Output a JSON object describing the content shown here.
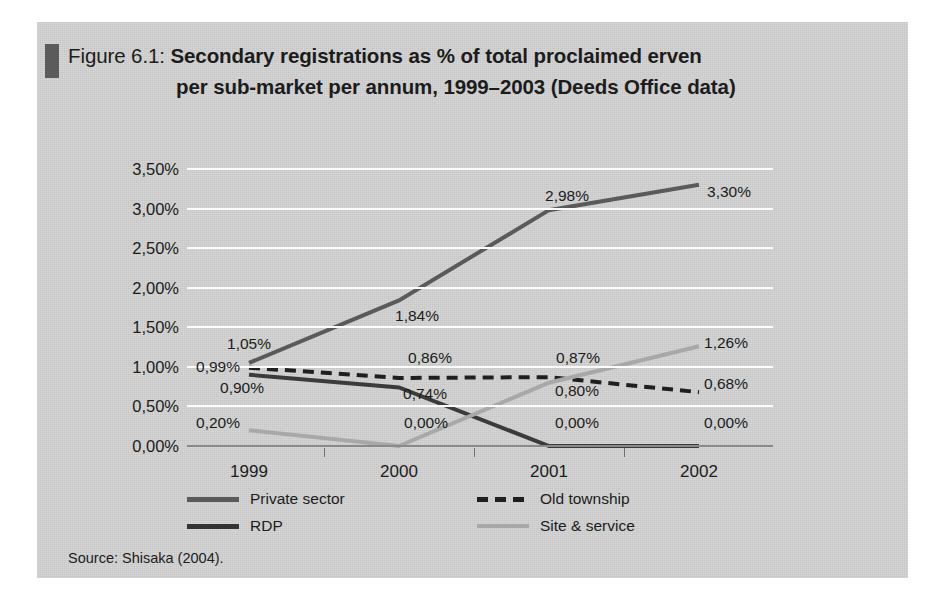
{
  "figure": {
    "title_prefix": "Figure 6.1: ",
    "title_line1": "Secondary registrations as % of total proclaimed erven",
    "title_line2": "per sub-market per annum, 1999–2003 (Deeds Office data)",
    "source": "Source: Shisaka (2004).",
    "panel_color": "#d4d4d4",
    "marker_color": "#5b5b5b"
  },
  "chart_data": {
    "type": "line",
    "title": "Figure 6.1: Secondary registrations as % of total proclaimed erven per sub-market per annum, 1999–2003 (Deeds Office data)",
    "xlabel": "",
    "ylabel": "",
    "categories": [
      "1999",
      "2000",
      "2001",
      "2002"
    ],
    "ylim": [
      0,
      3.5
    ],
    "yticks": [
      0,
      0.5,
      1.0,
      1.5,
      2.0,
      2.5,
      3.0,
      3.5
    ],
    "ytick_labels": [
      "0,00%",
      "0,50%",
      "1,00%",
      "1,50%",
      "2,00%",
      "2,50%",
      "3,00%",
      "3,50%"
    ],
    "grid": true,
    "legend_position": "bottom",
    "decimal_separator": ",",
    "series": [
      {
        "name": "Private sector",
        "color": "#5a5a5a",
        "style": "solid",
        "width": 4,
        "values": [
          1.05,
          1.84,
          2.98,
          3.3
        ],
        "labels": [
          "1,05%",
          "1,84%",
          "2,98%",
          "3,30%"
        ]
      },
      {
        "name": "RDP",
        "color": "#3b3b3b",
        "style": "solid",
        "width": 4,
        "values": [
          0.9,
          0.74,
          0.0,
          0.0
        ],
        "labels": [
          "0,90%",
          "0,74%",
          "0,00%",
          "0,00%"
        ]
      },
      {
        "name": "Old township",
        "color": "#1f1f1f",
        "style": "dashed",
        "width": 4,
        "values": [
          0.99,
          0.86,
          0.87,
          0.68
        ],
        "labels": [
          "0,99%",
          "0,86%",
          "0,87%",
          "0,68%"
        ]
      },
      {
        "name": "Site & service",
        "color": "#a8a8a8",
        "style": "solid",
        "width": 4,
        "values": [
          0.2,
          0.0,
          0.8,
          1.26
        ],
        "labels": [
          "0,20%",
          "0,00%",
          "0,80%",
          "1,26%"
        ]
      }
    ],
    "point_labels": [
      {
        "text": "1,05%",
        "x": 212,
        "y": 322
      },
      {
        "text": "0,99%",
        "x": 181,
        "y": 345
      },
      {
        "text": "0,90%",
        "x": 205,
        "y": 366
      },
      {
        "text": "0,20%",
        "x": 181,
        "y": 401
      },
      {
        "text": "1,84%",
        "x": 380,
        "y": 294
      },
      {
        "text": "0,86%",
        "x": 393,
        "y": 336
      },
      {
        "text": "0,74%",
        "x": 388,
        "y": 372
      },
      {
        "text": "0,00%",
        "x": 389,
        "y": 401
      },
      {
        "text": "2,98%",
        "x": 530,
        "y": 174
      },
      {
        "text": "0,87%",
        "x": 541,
        "y": 336
      },
      {
        "text": "0,80%",
        "x": 540,
        "y": 369
      },
      {
        "text": "0,00%",
        "x": 540,
        "y": 401
      },
      {
        "text": "3,30%",
        "x": 692,
        "y": 170
      },
      {
        "text": "1,26%",
        "x": 689,
        "y": 321
      },
      {
        "text": "0,68%",
        "x": 689,
        "y": 362
      },
      {
        "text": "0,00%",
        "x": 689,
        "y": 401
      }
    ]
  },
  "legend": {
    "items": [
      {
        "label": "Private sector",
        "color": "#5a5a5a",
        "style": "solid",
        "left": 0,
        "top": 0
      },
      {
        "label": "RDP",
        "color": "#333333",
        "style": "solid",
        "left": 0,
        "top": 27
      },
      {
        "label": "Old township",
        "color": "#1f1f1f",
        "style": "dashed",
        "left": 290,
        "top": 0
      },
      {
        "label": "Site & service",
        "color": "#a8a8a8",
        "style": "solid",
        "left": 290,
        "top": 27
      }
    ]
  }
}
